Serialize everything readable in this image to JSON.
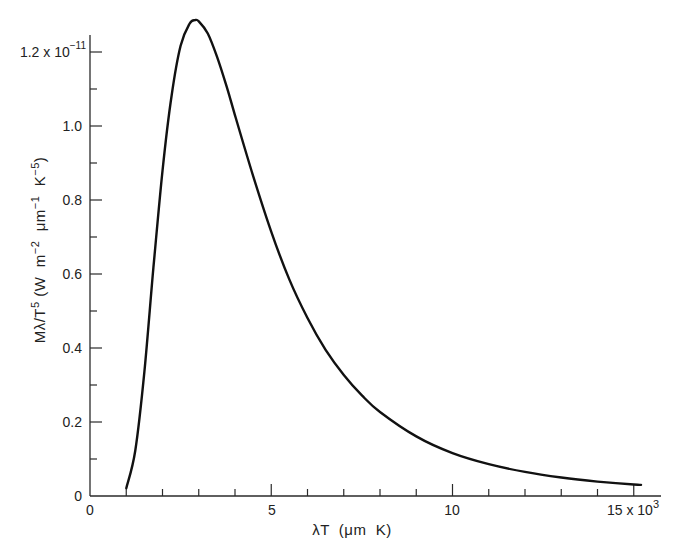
{
  "chart_data": {
    "type": "line",
    "title": "",
    "xlabel": "λT (μm K)",
    "ylabel": "Mλ/T^5 (W m^-2 μm^-1 K^-5)",
    "x_multiplier_label": "15 x 10^3",
    "y_multiplier_label": "1.2 x 10^-11",
    "xlim": [
      0,
      16000
    ],
    "ylim": [
      0,
      1.3e-11
    ],
    "grid": false,
    "legend": null,
    "x_ticks_major": [
      0,
      5000,
      10000,
      15000
    ],
    "x_tick_labels": [
      "0",
      "5",
      "10",
      "15"
    ],
    "x_ticks_minor": [
      1000,
      2000,
      3000,
      4000,
      6000,
      7000,
      8000,
      9000,
      11000,
      12000,
      13000,
      14000
    ],
    "y_ticks_major": [
      0,
      2e-12,
      4e-12,
      6e-12,
      8e-12,
      1e-11,
      1.2e-11
    ],
    "y_tick_labels": [
      "0",
      "0.2",
      "0.4",
      "0.6",
      "0.8",
      "1.0",
      "1.2"
    ],
    "y_ticks_minor": [
      1e-12,
      3e-12,
      5e-12,
      7e-12,
      9e-12,
      1.1e-11
    ],
    "series": [
      {
        "name": "Blackbody spectral exitance / T^5",
        "x": [
          1000,
          1250,
          1500,
          1750,
          2000,
          2250,
          2500,
          2750,
          2898,
          3000,
          3250,
          3500,
          3750,
          4000,
          4500,
          5000,
          5500,
          6000,
          6500,
          7000,
          7500,
          8000,
          9000,
          10000,
          11000,
          12000,
          13000,
          14000,
          15000,
          15200
        ],
        "values_e-11": [
          0.021,
          0.123,
          0.336,
          0.617,
          0.879,
          1.082,
          1.217,
          1.277,
          1.286,
          1.283,
          1.25,
          1.188,
          1.113,
          1.029,
          0.865,
          0.714,
          0.585,
          0.481,
          0.395,
          0.327,
          0.272,
          0.227,
          0.161,
          0.116,
          0.086,
          0.065,
          0.05,
          0.039,
          0.031,
          0.03
        ]
      }
    ],
    "peak": {
      "x": 2898,
      "y_e-11": 1.286
    }
  },
  "labels": {
    "x_ticks": [
      "0",
      "5",
      "10",
      "15 x 10"
    ],
    "x_exp": "3",
    "y_ticks": [
      "0",
      "0.2",
      "0.4",
      "0.6",
      "0.8",
      "1.0",
      "1.2 x 10"
    ],
    "y_exp": "−11",
    "xlabel": "λT  (μm  K)",
    "ylabel_main": "Mλ/T",
    "ylabel_units": "(W  m",
    "ylabel_sup5": "5",
    "ylabel_m2": "−2",
    "ylabel_um": "μm",
    "ylabel_um1": "−1",
    "ylabel_k": "K",
    "ylabel_k5": "−5",
    "ylabel_close": ")"
  },
  "colors": {
    "curve": "#111111",
    "axis": "#2a2a2a",
    "background": "#ffffff"
  }
}
